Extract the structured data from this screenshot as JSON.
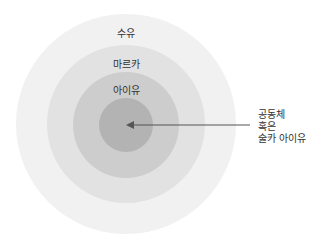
{
  "diagram": {
    "type": "concentric-circles",
    "rings": [
      {
        "label": "수유",
        "color": "#f1f1f1"
      },
      {
        "label": "마르카",
        "color": "#e0e0e0"
      },
      {
        "label": "아이유",
        "color": "#cbcbcb"
      },
      {
        "label": "",
        "color": "#b2b2b2"
      }
    ],
    "annotation": {
      "lines": [
        "공동체",
        "혹은",
        "술카 아이유"
      ],
      "points_to": "center"
    }
  }
}
